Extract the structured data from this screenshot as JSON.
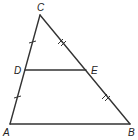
{
  "diagram": {
    "type": "geometry-triangle-midsegment",
    "points": {
      "A": {
        "label": "A",
        "x": 10,
        "y": 124,
        "lx": 3,
        "ly": 135
      },
      "B": {
        "label": "B",
        "x": 130,
        "y": 124,
        "lx": 128,
        "ly": 135
      },
      "C": {
        "label": "C",
        "x": 40,
        "y": 15,
        "lx": 37,
        "ly": 11
      },
      "D": {
        "label": "D",
        "x": 25,
        "y": 70,
        "lx": 14,
        "ly": 74
      },
      "E": {
        "label": "E",
        "x": 86,
        "y": 70,
        "lx": 91,
        "ly": 74
      }
    },
    "segments": [
      "CA",
      "CB",
      "AB",
      "DE"
    ],
    "congruence_marks": [
      {
        "segment": "CD",
        "ticks": 1
      },
      {
        "segment": "DA",
        "ticks": 1
      },
      {
        "segment": "CE",
        "ticks": 2
      },
      {
        "segment": "EB",
        "ticks": 2
      }
    ],
    "colors": {
      "line": "#333333",
      "background": "#ffffff"
    }
  }
}
